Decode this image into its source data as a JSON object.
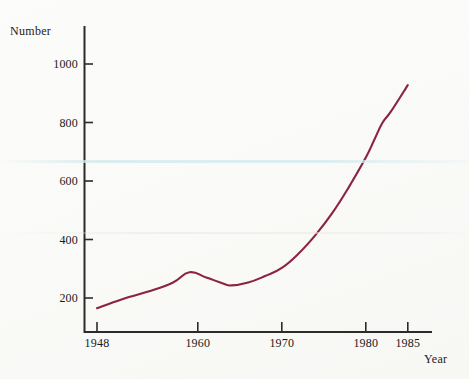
{
  "chart_data": {
    "type": "line",
    "title": "",
    "xlabel": "Year",
    "ylabel": "Number",
    "xlim": [
      1946,
      1987
    ],
    "ylim": [
      100,
      1100
    ],
    "grid": false,
    "legend": null,
    "x_ticks": [
      {
        "value": 1948,
        "label": "1948"
      },
      {
        "value": 1960,
        "label": "1960"
      },
      {
        "value": 1970,
        "label": "1970"
      },
      {
        "value": 1980,
        "label": "1980"
      },
      {
        "value": 1985,
        "label": "1985"
      }
    ],
    "y_ticks": [
      {
        "value": 200,
        "label": "200"
      },
      {
        "value": 400,
        "label": "400"
      },
      {
        "value": 600,
        "label": "600"
      },
      {
        "value": 800,
        "label": "800"
      },
      {
        "value": 1000,
        "label": "1000"
      }
    ],
    "series": [
      {
        "name": "Number",
        "color": "#8b2342",
        "x": [
          1948,
          1951,
          1954,
          1957,
          1959,
          1961,
          1963,
          1964,
          1966,
          1968,
          1970,
          1972,
          1974,
          1976,
          1978,
          1980,
          1981,
          1982,
          1983,
          1985
        ],
        "values": [
          165,
          196,
          221,
          252,
          288,
          270,
          250,
          243,
          253,
          275,
          303,
          352,
          415,
          490,
          580,
          680,
          740,
          800,
          838,
          928
        ]
      }
    ],
    "annotations": []
  },
  "axis": {
    "line_color": "#2b2b2b",
    "origin_px": {
      "x": 84,
      "y": 332
    },
    "y_axis_top_px": 26,
    "x_axis_right_px": 432
  }
}
